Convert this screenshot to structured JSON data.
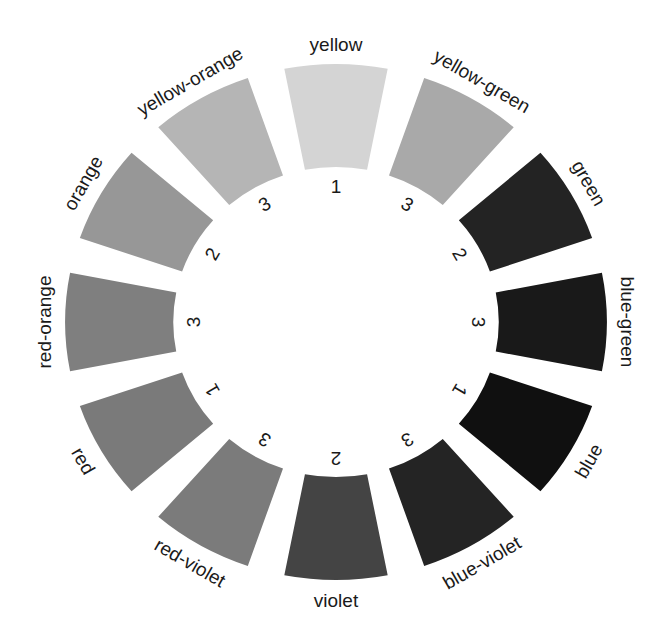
{
  "diagram": {
    "center": [
      336,
      322
    ],
    "scale_x": 1.05,
    "outer_radius": 258,
    "inner_radius": 155,
    "segment_span_deg": 22,
    "label_radius": 278,
    "number_radius": 136,
    "segments": [
      {
        "name": "yellow",
        "number": "1",
        "angle": -90,
        "fill": "#d4d4d4"
      },
      {
        "name": "yellow-green",
        "number": "3",
        "angle": -60,
        "fill": "#a9a9a9"
      },
      {
        "name": "green",
        "number": "2",
        "angle": -30,
        "fill": "#232323"
      },
      {
        "name": "blue-green",
        "number": "3",
        "angle": 0,
        "fill": "#191919"
      },
      {
        "name": "blue",
        "number": "1",
        "angle": 30,
        "fill": "#101010"
      },
      {
        "name": "blue-violet",
        "number": "3",
        "angle": 60,
        "fill": "#242424"
      },
      {
        "name": "violet",
        "number": "2",
        "angle": 90,
        "fill": "#444444"
      },
      {
        "name": "red-violet",
        "number": "3",
        "angle": 120,
        "fill": "#7b7b7b"
      },
      {
        "name": "red",
        "number": "1",
        "angle": 150,
        "fill": "#7a7a7a"
      },
      {
        "name": "red-orange",
        "number": "3",
        "angle": 180,
        "fill": "#7f7f7f"
      },
      {
        "name": "orange",
        "number": "2",
        "angle": 210,
        "fill": "#979797"
      },
      {
        "name": "yellow-orange",
        "number": "3",
        "angle": 240,
        "fill": "#b5b5b5"
      }
    ]
  }
}
